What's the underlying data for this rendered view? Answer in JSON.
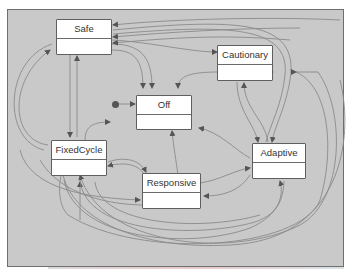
{
  "diagram": {
    "type": "state-machine",
    "background_color": "#c9c9c9",
    "edge_color": "#7a7a7a",
    "states": [
      {
        "id": "safe",
        "label": "Safe"
      },
      {
        "id": "cautionary",
        "label": "Cautionary"
      },
      {
        "id": "off",
        "label": "Off"
      },
      {
        "id": "fixedcycle",
        "label": "FixedCycle"
      },
      {
        "id": "responsive",
        "label": "Responsive"
      },
      {
        "id": "adaptive",
        "label": "Adaptive"
      }
    ],
    "initial_state": "off",
    "transitions": [
      {
        "from": "safe",
        "to": "off"
      },
      {
        "from": "safe",
        "to": "fixedcycle"
      },
      {
        "from": "fixedcycle",
        "to": "safe"
      },
      {
        "from": "safe",
        "to": "cautionary"
      },
      {
        "from": "cautionary",
        "to": "safe"
      },
      {
        "from": "adaptive",
        "to": "safe"
      },
      {
        "from": "cautionary",
        "to": "off"
      },
      {
        "from": "cautionary",
        "to": "adaptive"
      },
      {
        "from": "adaptive",
        "to": "cautionary"
      },
      {
        "from": "fixedcycle",
        "to": "off"
      },
      {
        "from": "fixedcycle",
        "to": "responsive"
      },
      {
        "from": "responsive",
        "to": "fixedcycle"
      },
      {
        "from": "responsive",
        "to": "off"
      },
      {
        "from": "responsive",
        "to": "adaptive"
      },
      {
        "from": "adaptive",
        "to": "responsive"
      },
      {
        "from": "adaptive",
        "to": "off"
      },
      {
        "from": "adaptive",
        "to": "fixedcycle"
      },
      {
        "from": "responsive",
        "to": "cautionary"
      },
      {
        "from": "fixedcycle",
        "to": "adaptive"
      },
      {
        "from": "cautionary",
        "to": "fixedcycle"
      }
    ]
  }
}
